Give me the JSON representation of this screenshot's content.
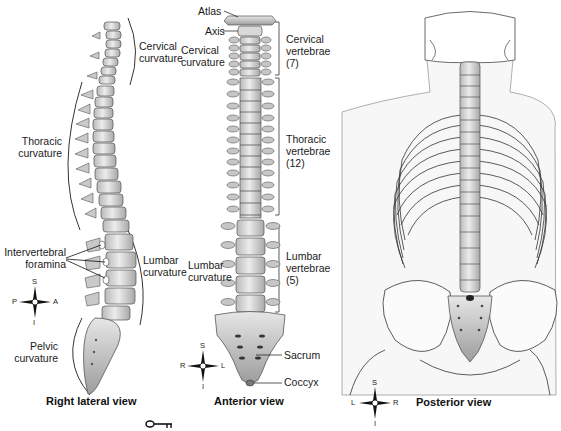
{
  "diagram": {
    "views": [
      {
        "id": "right-lateral",
        "title": "Right lateral view",
        "labels": {
          "cervical_curvature": [
            "Cervical",
            "curvature"
          ],
          "thoracic_curvature": [
            "Thoracic",
            "curvature"
          ],
          "intervertebral_foramina": [
            "Intervertebral",
            "foramina"
          ],
          "lumbar_curvature": [
            "Lumbar",
            "curvature"
          ],
          "pelvic_curvature": [
            "Pelvic",
            "curvature"
          ]
        },
        "compass": {
          "top": "S",
          "bottom": "I",
          "left": "P",
          "right": "A"
        }
      },
      {
        "id": "anterior",
        "title": "Anterior view",
        "labels": {
          "atlas": "Atlas",
          "axis": "Axis",
          "cervical_curvature": [
            "Cervical",
            "curvature"
          ],
          "cervical_vertebrae": [
            "Cervical",
            "vertebrae",
            "(7)"
          ],
          "thoracic_vertebrae": [
            "Thoracic",
            "vertebrae",
            "(12)"
          ],
          "lumbar_curvature": [
            "Lumbar",
            "curvature"
          ],
          "lumbar_vertebrae": [
            "Lumbar",
            "vertebrae",
            "(5)"
          ],
          "sacrum": "Sacrum",
          "coccyx": "Coccyx"
        },
        "compass": {
          "top": "S",
          "bottom": "I",
          "left": "R",
          "right": "L"
        }
      },
      {
        "id": "posterior",
        "title": "Posterior view",
        "compass": {
          "top": "S",
          "bottom": "I",
          "left": "L",
          "right": "R"
        }
      }
    ],
    "key_icon": "key-icon"
  }
}
